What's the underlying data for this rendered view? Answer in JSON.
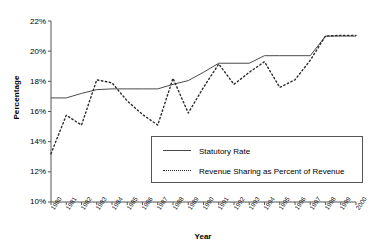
{
  "chart_data": {
    "type": "line",
    "title": "",
    "xlabel": "Year",
    "ylabel": "Percentage",
    "grid": false,
    "legend_position": "inside-lower-right",
    "xlim": [
      1980,
      2000
    ],
    "ylim": [
      10,
      22
    ],
    "ytick_labels": [
      "22%",
      "20%",
      "18%",
      "16%",
      "14%",
      "12%",
      "10%"
    ],
    "ytick_values": [
      22,
      20,
      18,
      16,
      14,
      12,
      10
    ],
    "categories": [
      "1980",
      "1981",
      "1982",
      "1983",
      "1984",
      "1985",
      "1986",
      "1987",
      "1988",
      "1989",
      "1990",
      "1991",
      "1992",
      "1993",
      "1994",
      "1995",
      "1996",
      "1997",
      "1998",
      "1999",
      "2000"
    ],
    "series": [
      {
        "name": "Statutory Rate",
        "style": "solid",
        "color": "#4a4a4a",
        "values": [
          16.9,
          16.9,
          17.2,
          17.45,
          17.5,
          17.5,
          17.5,
          17.5,
          17.8,
          18.05,
          18.6,
          19.2,
          19.2,
          19.2,
          19.7,
          19.7,
          19.7,
          19.7,
          21.0,
          21.0,
          21.0
        ]
      },
      {
        "name": "Revenue Sharing as Percent of Revenue",
        "style": "dotted",
        "color": "#2a2a2a",
        "values": [
          13.2,
          15.75,
          15.1,
          18.1,
          17.9,
          16.7,
          15.8,
          15.1,
          18.2,
          15.9,
          17.6,
          19.15,
          17.8,
          18.6,
          19.3,
          17.6,
          18.1,
          19.4,
          21.0,
          21.05,
          21.05
        ]
      }
    ]
  }
}
